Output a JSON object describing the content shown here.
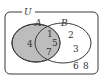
{
  "diagram": {
    "type": "venn",
    "universe_label": "U",
    "sets": [
      {
        "label": "A",
        "shaded": true
      },
      {
        "label": "B",
        "shaded": false
      }
    ],
    "regions": {
      "a_only": [
        "4"
      ],
      "a_and_b": [
        "1",
        "5",
        "7"
      ],
      "b_only": [
        "2",
        "3"
      ],
      "neither": [
        "6",
        "8"
      ]
    },
    "colors": {
      "shade": "#bdbdbd",
      "stroke": "#3a3a3a",
      "background": "#ffffff"
    }
  }
}
